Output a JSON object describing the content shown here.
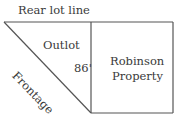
{
  "diagram": {
    "labels": {
      "rear_lot_line": "Rear lot line",
      "outlot": "Outlot",
      "frontage": "Frontage",
      "dimension": "86'",
      "property_line1": "Robinson",
      "property_line2": "Property"
    },
    "colors": {
      "line": "#555555",
      "text": "#3a3a3a"
    }
  }
}
